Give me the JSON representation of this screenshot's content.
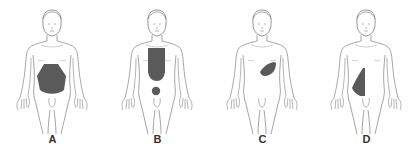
{
  "diagram": {
    "type": "anatomical-body-outlines",
    "outline_color": "#6a6a6a",
    "shade_color": "#5a5a5a",
    "figures": [
      {
        "label": "A",
        "region": "lower-abdomen-diffuse"
      },
      {
        "label": "B",
        "region": "epigastric-substernal-and-umbilical"
      },
      {
        "label": "C",
        "region": "left-upper-quadrant"
      },
      {
        "label": "D",
        "region": "right-flank-lower-quadrant"
      }
    ]
  }
}
